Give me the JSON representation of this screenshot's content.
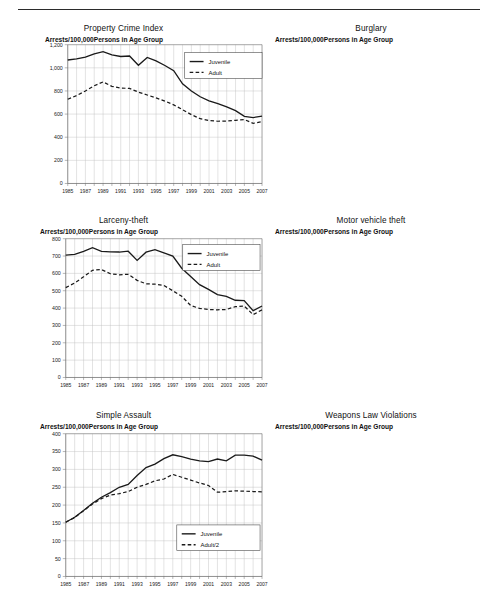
{
  "page": {
    "rule": "horizontal-rule"
  },
  "axis_subtitle": "Arrests/100,000Persons in Age Group",
  "xtick_labels": [
    "1985",
    "1987",
    "1989",
    "1991",
    "1993",
    "1995",
    "1997",
    "1999",
    "2001",
    "2003",
    "2005",
    "2007"
  ],
  "years": [
    1985,
    1986,
    1987,
    1988,
    1989,
    1990,
    1991,
    1992,
    1993,
    1994,
    1995,
    1996,
    1997,
    1998,
    1999,
    2000,
    2001,
    2002,
    2003,
    2004,
    2005,
    2006,
    2007
  ],
  "colors": {
    "line": "#1a1a1a",
    "grid": "#bfbfbf",
    "axis": "#6d6d6d",
    "text": "#1a1a1a",
    "background": "#ffffff"
  },
  "chart_data": [
    {
      "type": "line",
      "title": "Property Crime Index",
      "xlabel": "",
      "ylabel": "Arrests/100,000Persons in Age Group",
      "ylim": [
        0,
        1200
      ],
      "ystep": 200,
      "ytick_labels": [
        "0",
        "200",
        "400",
        "600",
        "800",
        "1,000",
        "1,200"
      ],
      "xlim": [
        1985,
        2007
      ],
      "grid": true,
      "legend_position": "top-right",
      "series": [
        {
          "name": "Juvenile",
          "style": "solid",
          "values": [
            1068,
            1078,
            1092,
            1120,
            1140,
            1112,
            1098,
            1102,
            1022,
            1090,
            1060,
            1020,
            975,
            862,
            800,
            750,
            715,
            690,
            662,
            630,
            580,
            570,
            582
          ]
        },
        {
          "name": "Adult",
          "style": "dashed",
          "values": [
            728,
            760,
            800,
            845,
            878,
            840,
            825,
            822,
            790,
            765,
            740,
            712,
            680,
            638,
            595,
            560,
            545,
            538,
            540,
            546,
            552,
            520,
            535
          ]
        }
      ]
    },
    {
      "type": "line",
      "title": "Burglary",
      "xlabel": "",
      "ylabel": "Arrests/100,000Persons in Age Group",
      "ylim": [
        0,
        300
      ],
      "ystep": 50,
      "ytick_labels": [
        "0",
        "50",
        "100",
        "150",
        "200",
        "250",
        "300"
      ],
      "xlim": [
        1985,
        2007
      ],
      "grid": true,
      "legend_position": "top-right",
      "series": [
        {
          "name": "Juvenile",
          "style": "solid",
          "values": [
            270,
            258,
            248,
            243,
            236,
            228,
            220,
            222,
            216,
            203,
            209,
            196,
            190,
            175,
            163,
            140,
            128,
            120,
            115,
            111,
            108,
            117,
            114
          ]
        },
        {
          "name": "Adult",
          "style": "dashed",
          "values": [
            156,
            159,
            165,
            171,
            175,
            166,
            163,
            160,
            150,
            143,
            136,
            130,
            122,
            112,
            104,
            97,
            96,
            98,
            98,
            99,
            100,
            99,
            101
          ]
        }
      ]
    },
    {
      "type": "line",
      "title": "Larceny-theft",
      "xlabel": "",
      "ylabel": "Arrests/100,000Persons in Age Group",
      "ylim": [
        0,
        800
      ],
      "ystep": 100,
      "ytick_labels": [
        "0",
        "100",
        "200",
        "300",
        "400",
        "500",
        "600",
        "700",
        "800"
      ],
      "xlim": [
        1985,
        2007
      ],
      "grid": true,
      "legend_position": "top-right",
      "series": [
        {
          "name": "Juvenile",
          "style": "solid",
          "values": [
            705,
            710,
            727,
            748,
            727,
            724,
            723,
            728,
            675,
            722,
            737,
            718,
            700,
            630,
            582,
            535,
            508,
            478,
            468,
            445,
            443,
            385,
            412
          ]
        },
        {
          "name": "Adult",
          "style": "dashed",
          "values": [
            518,
            545,
            580,
            618,
            622,
            598,
            592,
            595,
            560,
            540,
            538,
            530,
            500,
            468,
            415,
            398,
            392,
            390,
            392,
            408,
            412,
            362,
            390
          ]
        }
      ]
    },
    {
      "type": "line",
      "title": "Motor vehicle theft",
      "xlabel": "",
      "ylabel": "Arrests/100,000Persons in Age Group",
      "ylim": [
        0,
        160
      ],
      "ystep": 20,
      "ytick_labels": [
        "0",
        "20",
        "40",
        "60",
        "80",
        "100",
        "120",
        "140",
        "160"
      ],
      "xlim": [
        1985,
        2007
      ],
      "grid": true,
      "legend_position": "top-right",
      "series": [
        {
          "name": "Juvenile",
          "style": "solid",
          "values": [
            80,
            92,
            106,
            130,
            147,
            143,
            139,
            135,
            130,
            129,
            121,
            110,
            100,
            79,
            75,
            72,
            68,
            64,
            60,
            55,
            52,
            46,
            41
          ]
        },
        {
          "name": "Adult",
          "style": "dashed",
          "values": [
            47,
            49,
            56,
            66,
            73,
            66,
            62,
            60,
            58,
            57,
            58,
            55,
            52,
            49,
            47,
            48,
            49,
            50,
            51,
            52,
            51,
            46,
            41
          ]
        }
      ]
    },
    {
      "type": "line",
      "title": "Simple Assault",
      "xlabel": "",
      "ylabel": "Arrests/100,000Persons in Age Group",
      "ylim": [
        0,
        400
      ],
      "ystep": 50,
      "ytick_labels": [
        "0",
        "50",
        "100",
        "150",
        "200",
        "250",
        "300",
        "350",
        "400"
      ],
      "xlim": [
        1985,
        2007
      ],
      "grid": true,
      "legend_position": "bottom-right",
      "series": [
        {
          "name": "Juvenile",
          "style": "solid",
          "values": [
            152,
            166,
            185,
            205,
            222,
            235,
            250,
            258,
            283,
            305,
            315,
            330,
            341,
            336,
            329,
            324,
            322,
            329,
            324,
            340,
            340,
            337,
            326
          ]
        },
        {
          "name": "Adult/2",
          "style": "dashed",
          "values": [
            152,
            165,
            184,
            203,
            218,
            228,
            232,
            238,
            250,
            258,
            268,
            273,
            286,
            278,
            270,
            262,
            255,
            236,
            238,
            240,
            239,
            238,
            237
          ]
        }
      ]
    },
    {
      "type": "line",
      "title": "Weapons Law Violations",
      "xlabel": "",
      "ylabel": "Arrests/100,000Persons in Age Group",
      "ylim": [
        0,
        100
      ],
      "ystep": 10,
      "ytick_labels": [
        "0",
        "10",
        "20",
        "30",
        "40",
        "50",
        "60",
        "70",
        "80",
        "90",
        "100"
      ],
      "xlim": [
        1985,
        2007
      ],
      "grid": true,
      "legend_position": "top-right",
      "series": [
        {
          "name": "Juvenile",
          "style": "solid",
          "values": [
            48,
            48,
            47,
            55,
            62,
            62,
            70,
            78,
            88,
            92,
            87,
            79,
            73,
            62,
            51,
            51,
            49,
            53,
            57,
            62,
            65,
            64,
            59
          ]
        },
        {
          "name": "Adult/2",
          "style": "dashed",
          "values": [
            43,
            46,
            45,
            51,
            51,
            50,
            50,
            50,
            52,
            51,
            45,
            42,
            40,
            36,
            30,
            30,
            31,
            31,
            32,
            34,
            35,
            34,
            32
          ]
        }
      ]
    }
  ],
  "legends": [
    {
      "items": [
        "Juvenile",
        "Adult"
      ]
    },
    {
      "items": [
        "Juvenile",
        "Adult"
      ]
    },
    {
      "items": [
        "Juvenile",
        "Adult"
      ]
    },
    {
      "items": [
        "Juvenile",
        "Adult"
      ]
    },
    {
      "items": [
        "Juvenile",
        "Adult/2"
      ]
    },
    {
      "items": [
        "Juvenile",
        "Adult/2"
      ]
    }
  ]
}
